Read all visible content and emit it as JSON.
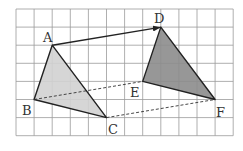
{
  "grid": {
    "origin_x": 16,
    "origin_y": 9,
    "cell": 18.1,
    "cols": 12,
    "rows": 7,
    "line_color": "#9a9a9a",
    "border_color": "#7a7a7a"
  },
  "points": {
    "A": {
      "label": "A",
      "col": 2,
      "row": 2
    },
    "B": {
      "label": "B",
      "col": 1,
      "row": 5
    },
    "C": {
      "label": "C",
      "col": 5,
      "row": 6
    },
    "D": {
      "label": "D",
      "col": 8,
      "row": 1
    },
    "E": {
      "label": "E",
      "col": 7,
      "row": 4
    },
    "F": {
      "label": "F",
      "col": 11,
      "row": 5
    }
  },
  "triangles": [
    {
      "name": "triangle-abc",
      "vertices": [
        "A",
        "B",
        "C"
      ],
      "fill": "#d2d2d2"
    },
    {
      "name": "triangle-def",
      "vertices": [
        "D",
        "E",
        "F"
      ],
      "fill": "#8c8c8c"
    }
  ],
  "translation_arrow": {
    "from": "A",
    "to": "D"
  },
  "dashed_segments": [
    [
      "B",
      "E"
    ],
    [
      "C",
      "F"
    ]
  ],
  "labels": {
    "A": "A",
    "B": "B",
    "C": "C",
    "D": "D",
    "E": "E",
    "F": "F"
  }
}
